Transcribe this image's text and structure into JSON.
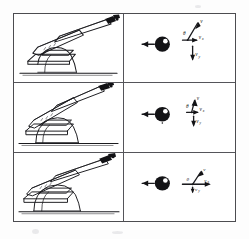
{
  "figure": {
    "frame_color": "#4c4c50",
    "ink_color": "#1b1b1f",
    "paper_color": "#ffffff",
    "background_color": "#fdfdfd",
    "panel_count": 6,
    "row_count": 3,
    "column_count": 2,
    "columns": [
      {
        "key": "gun",
        "label": "Gun at elevation"
      },
      {
        "key": "vector",
        "label": "Projectile and velocity vectors"
      }
    ],
    "rows": [
      {
        "index": 1,
        "gun": {
          "icon": "artillery-gun-icon",
          "elevation_deg": 30,
          "barrel_label": "",
          "ground_label": ""
        },
        "vector": {
          "projectile_icon": "projectile-shell-icon",
          "recoil_arrow": "arrow-left",
          "resultant_label": "v",
          "horizontal_label": "v",
          "horizontal_sub": "x",
          "vertical_label": "v",
          "vertical_sub": "y",
          "angle_label": "θ",
          "angle_deg": 60
        }
      },
      {
        "index": 2,
        "gun": {
          "icon": "artillery-gun-icon",
          "elevation_deg": 37,
          "barrel_label": "",
          "ground_label": ""
        },
        "vector": {
          "projectile_icon": "projectile-shell-icon",
          "recoil_arrow": "arrow-left",
          "resultant_label": "v",
          "horizontal_label": "v",
          "horizontal_sub": "x",
          "vertical_label": "v",
          "vertical_sub": "y",
          "angle_label": "θ",
          "angle_deg": 75
        }
      },
      {
        "index": 3,
        "gun": {
          "icon": "artillery-gun-icon",
          "elevation_deg": 25,
          "barrel_label": "",
          "ground_label": ""
        },
        "vector": {
          "projectile_icon": "projectile-shell-icon",
          "recoil_arrow": "arrow-left",
          "resultant_label": "v",
          "horizontal_label": "v",
          "horizontal_sub": "x",
          "vertical_label": "v",
          "vertical_sub": "y",
          "angle_label": "θ",
          "angle_deg": 25
        }
      }
    ]
  }
}
